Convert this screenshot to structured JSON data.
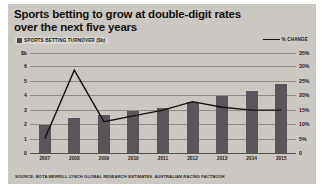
{
  "title": {
    "line1": "Sports betting to grow at double-digit rates",
    "line2": "over the next five years"
  },
  "legend": {
    "bars": "SPORTS BETTING TURNOVER ($b)",
    "line": "% CHANGE"
  },
  "source": "SOURCE: BOTA MERRILL LYNCH GLOBAL RESEARCH ESTIMATES, AUSTRALIAN RACING FACTBOOK",
  "axis": {
    "left_ticks": [
      "$b",
      "6",
      "5",
      "4",
      "3",
      "2",
      "1",
      "0"
    ],
    "right_ticks": [
      "35%",
      "30%",
      "25%",
      "20%",
      "15%",
      "10%",
      "5%",
      "0"
    ]
  },
  "colors": {
    "bar": "#58565a",
    "line": "#14120f",
    "background": "#cbc8c3",
    "gridline": "#8e8b86",
    "text": "#15120f"
  },
  "chart_data": {
    "type": "bar",
    "title": "Sports betting to grow at double-digit rates over the next five years",
    "xlabel": "",
    "ylabel": "SPORTS BETTING TURNOVER ($b)",
    "y2label": "% CHANGE",
    "categories": [
      "2007",
      "2008",
      "2009",
      "2010",
      "2011",
      "2012",
      "2013",
      "2014",
      "2015"
    ],
    "series": [
      {
        "name": "SPORTS BETTING TURNOVER ($b)",
        "type": "bar",
        "axis": "left",
        "values": [
          1.8,
          2.3,
          2.5,
          2.7,
          2.9,
          3.3,
          3.7,
          4.0,
          4.5
        ]
      },
      {
        "name": "% CHANGE",
        "type": "line",
        "axis": "right",
        "values": [
          5,
          29,
          11,
          13,
          15,
          18,
          16,
          15,
          15
        ]
      }
    ],
    "ylim": [
      0,
      6.5
    ],
    "y2lim": [
      0,
      35
    ],
    "grid": true,
    "legend": "top"
  }
}
